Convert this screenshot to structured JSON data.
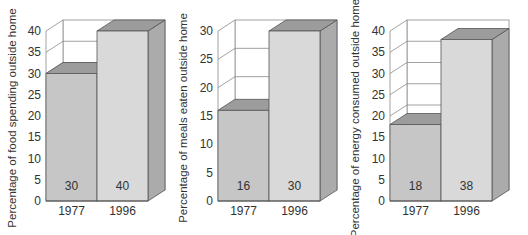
{
  "chart_data": [
    {
      "type": "bar",
      "style": "3d",
      "title": "",
      "xlabel": "",
      "ylabel": "Percentage of food spending outside home",
      "categories": [
        "1977",
        "1996"
      ],
      "values": [
        30,
        40
      ],
      "data_labels": [
        "30",
        "40"
      ],
      "ylim": [
        0,
        40
      ],
      "yticks": [
        0,
        5,
        10,
        15,
        20,
        25,
        30,
        35,
        40
      ]
    },
    {
      "type": "bar",
      "style": "3d",
      "title": "",
      "xlabel": "",
      "ylabel": "Percentage of meals eaten outside home",
      "categories": [
        "1977",
        "1996"
      ],
      "values": [
        16,
        30
      ],
      "data_labels": [
        "16",
        "30"
      ],
      "ylim": [
        0,
        30
      ],
      "yticks": [
        0,
        5,
        10,
        15,
        20,
        25,
        30
      ]
    },
    {
      "type": "bar",
      "style": "3d",
      "title": "",
      "xlabel": "",
      "ylabel": "Percentage of energy consumed outside home",
      "categories": [
        "1977",
        "1996"
      ],
      "values": [
        18,
        38
      ],
      "data_labels": [
        "18",
        "38"
      ],
      "ylim": [
        0,
        40
      ],
      "yticks": [
        0,
        5,
        10,
        15,
        20,
        25,
        30,
        35,
        40
      ]
    }
  ],
  "colors": {
    "bar_1977_front": "#c6c6c6",
    "bar_1996_front": "#d9d9d9",
    "bar_top": "#9c9c9c",
    "bar_side": "#ababab",
    "outline": "#555555",
    "grid": "#8a8a8a"
  }
}
